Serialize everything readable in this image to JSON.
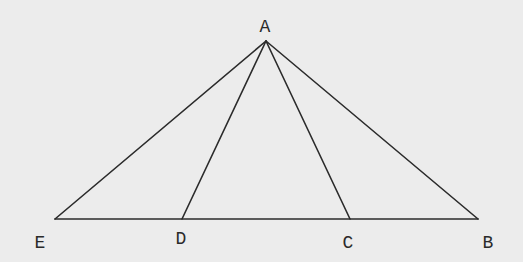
{
  "diagram": {
    "type": "geometry-triangle",
    "colors": {
      "background": "#ececec",
      "stroke": "#2b2b2b",
      "label": "#2a2a2a"
    },
    "points": {
      "A": {
        "label": "A",
        "x": 266,
        "y": 41,
        "lx": 265,
        "ly": 32
      },
      "E": {
        "label": "E",
        "x": 55,
        "y": 219,
        "lx": 40,
        "ly": 248
      },
      "D": {
        "label": "D",
        "x": 182,
        "y": 219,
        "lx": 181,
        "ly": 244
      },
      "C": {
        "label": "C",
        "x": 350,
        "y": 219,
        "lx": 348,
        "ly": 248
      },
      "B": {
        "label": "B",
        "x": 478,
        "y": 219,
        "lx": 488,
        "ly": 248
      }
    },
    "segments": [
      {
        "from": "A",
        "to": "E"
      },
      {
        "from": "A",
        "to": "D"
      },
      {
        "from": "A",
        "to": "C"
      },
      {
        "from": "A",
        "to": "B"
      },
      {
        "from": "E",
        "to": "B"
      }
    ]
  }
}
